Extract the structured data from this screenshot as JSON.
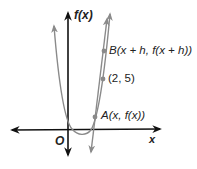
{
  "diagram": {
    "title": "",
    "axes": {
      "y_label": "f(x)",
      "x_label": "x",
      "origin_label": "O"
    },
    "curves": [
      {
        "name": "parabola",
        "description": "graph of f(x), upward-opening parabola",
        "color": "#8a8a8a"
      },
      {
        "name": "secant-line",
        "description": "secant line through A and B",
        "color": "#8a8a8a"
      }
    ],
    "points": [
      {
        "id": "B",
        "label": "B(x + h, f(x + h))"
      },
      {
        "id": "P",
        "label": "(2, 5)"
      },
      {
        "id": "A",
        "label": "A(x, f(x))"
      }
    ],
    "colors": {
      "axes": "#111111",
      "curve": "#8a8a8a",
      "point": "#8a8a8a",
      "text": "#222222"
    }
  }
}
